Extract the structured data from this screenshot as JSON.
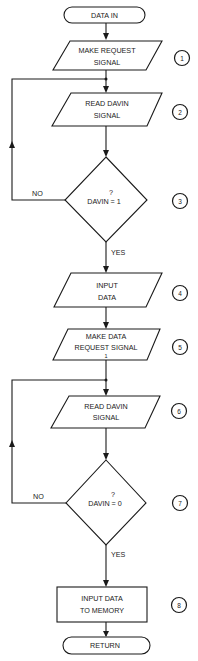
{
  "flowchart": {
    "start": {
      "label": "DATA IN"
    },
    "steps": [
      {
        "number": "1",
        "type": "io",
        "lines": [
          "MAKE REQUEST",
          "SIGNAL"
        ]
      },
      {
        "number": "2",
        "type": "io",
        "lines": [
          "READ DAVIN",
          "SIGNAL"
        ]
      },
      {
        "number": "3",
        "type": "decision",
        "lines": [
          "?",
          "DAVIN  = 1"
        ],
        "no_label": "NO",
        "yes_label": "YES"
      },
      {
        "number": "4",
        "type": "io",
        "lines": [
          "INPUT",
          "DATA"
        ]
      },
      {
        "number": "5",
        "type": "io",
        "lines": [
          "MAKE DATA",
          "REQUEST SIGNAL",
          "1"
        ]
      },
      {
        "number": "6",
        "type": "io",
        "lines": [
          "READ DAVIN",
          "SIGNAL"
        ]
      },
      {
        "number": "7",
        "type": "decision",
        "lines": [
          "?",
          "DAVIN  = 0"
        ],
        "no_label": "NO",
        "yes_label": "YES"
      },
      {
        "number": "8",
        "type": "process",
        "lines": [
          "INPUT DATA",
          "TO MEMORY"
        ]
      }
    ],
    "end": {
      "label": "RETURN"
    }
  }
}
